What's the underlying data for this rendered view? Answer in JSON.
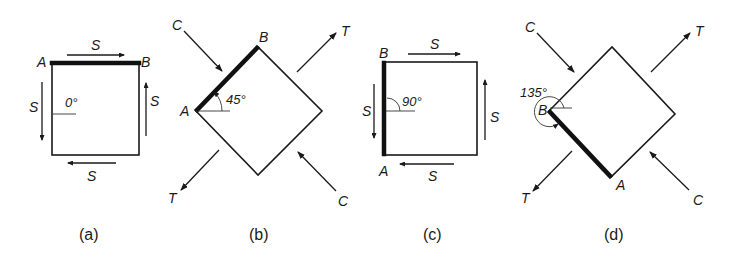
{
  "figure": {
    "panels": [
      {
        "id": "a",
        "caption": "(a)",
        "angle_label": "0°",
        "vertex_labels": {
          "A": "A",
          "B": "B"
        },
        "force_labels": {
          "top": "S",
          "bottom": "S",
          "left": "S",
          "right": "S"
        },
        "description": "Square element with edge AB horizontal on top; shear S on all four sides"
      },
      {
        "id": "b",
        "caption": "(b)",
        "angle_label": "45°",
        "vertex_labels": {
          "A": "A",
          "B": "B"
        },
        "force_labels": {
          "compression_top_left": "C",
          "compression_bottom_right": "C",
          "tension_top_right": "T",
          "tension_bottom_left": "T"
        },
        "description": "Element rotated 45°; compression C and tension T arrows"
      },
      {
        "id": "c",
        "caption": "(c)",
        "angle_label": "90°",
        "vertex_labels": {
          "A": "A",
          "B": "B"
        },
        "force_labels": {
          "top": "S",
          "bottom": "S",
          "left": "S",
          "right": "S"
        },
        "description": "Square element with edge AB vertical on left; shear S on all four sides"
      },
      {
        "id": "d",
        "caption": "(d)",
        "angle_label": "135°",
        "vertex_labels": {
          "A": "A",
          "B": "B"
        },
        "force_labels": {
          "compression_top_left": "C",
          "compression_bottom_right": "C",
          "tension_top_right": "T",
          "tension_bottom_left": "T"
        },
        "description": "Element rotated 135°; compression C and tension T arrows"
      }
    ]
  }
}
